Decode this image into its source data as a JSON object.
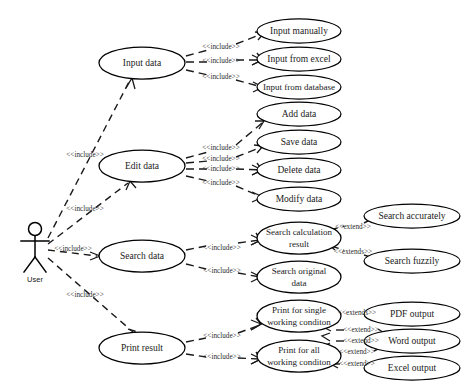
{
  "diagram": {
    "type": "uml-use-case-diagram",
    "actor": {
      "name": "User",
      "icon": "stick-figure-actor-icon"
    },
    "stereotypes": {
      "include": "<<include>>",
      "extend": "<<extend>>",
      "extends": "<<extends>>"
    },
    "primary_use_cases": [
      {
        "id": "input_data",
        "label": "Input data",
        "cx": 142,
        "cy": 63,
        "rx": 43,
        "ry": 16
      },
      {
        "id": "edit_data",
        "label": "Edit data",
        "cx": 142,
        "cy": 166,
        "rx": 43,
        "ry": 16
      },
      {
        "id": "search_data",
        "label": "Search data",
        "cx": 142,
        "cy": 256,
        "rx": 43,
        "ry": 16
      },
      {
        "id": "print_result",
        "label": "Print result",
        "cx": 142,
        "cy": 348,
        "rx": 43,
        "ry": 16
      }
    ],
    "secondary_use_cases": [
      {
        "id": "input_manually",
        "label": "Input manually",
        "cx": 299,
        "cy": 31,
        "rx": 42,
        "ry": 12
      },
      {
        "id": "input_from_excel",
        "label": "Input from excel",
        "cx": 299,
        "cy": 59,
        "rx": 42,
        "ry": 12
      },
      {
        "id": "input_from_database",
        "label": "Input from database",
        "cx": 299,
        "cy": 87,
        "rx": 42,
        "ry": 12
      },
      {
        "id": "add_data",
        "label": "Add data",
        "cx": 299,
        "cy": 114,
        "rx": 42,
        "ry": 12
      },
      {
        "id": "save_data",
        "label": "Save data",
        "cx": 299,
        "cy": 142,
        "rx": 42,
        "ry": 12
      },
      {
        "id": "delete_data",
        "label": "Delete data",
        "cx": 299,
        "cy": 170,
        "rx": 42,
        "ry": 12
      },
      {
        "id": "modify_data",
        "label": "Modify data",
        "cx": 299,
        "cy": 199,
        "rx": 42,
        "ry": 12
      },
      {
        "id": "search_calculation_result",
        "label": "Search calculation result",
        "line1": "Search calculation",
        "line2": "result",
        "cx": 299,
        "cy": 238,
        "rx": 42,
        "ry": 16
      },
      {
        "id": "search_original_data",
        "label": "Search original data",
        "line1": "Search original",
        "line2": "data",
        "cx": 299,
        "cy": 277,
        "rx": 42,
        "ry": 16
      },
      {
        "id": "print_single_working_condition",
        "label": "Print for single working condition",
        "line1": "Print for single",
        "line2": "working conditon",
        "cx": 299,
        "cy": 316,
        "rx": 42,
        "ry": 16
      },
      {
        "id": "print_all_working_condition",
        "label": "Print for all working condition",
        "line1": "Print for all",
        "line2": "working conditon",
        "cx": 299,
        "cy": 356,
        "rx": 42,
        "ry": 16
      }
    ],
    "extension_use_cases": [
      {
        "id": "search_accurately",
        "label": "Search accurately",
        "cx": 412,
        "cy": 216,
        "rx": 48,
        "ry": 12
      },
      {
        "id": "search_fuzzily",
        "label": "Search fuzzily",
        "cx": 412,
        "cy": 261,
        "rx": 48,
        "ry": 12
      },
      {
        "id": "pdf_output",
        "label": "PDF output",
        "cx": 412,
        "cy": 314,
        "rx": 48,
        "ry": 12
      },
      {
        "id": "word_output",
        "label": "Word output",
        "cx": 412,
        "cy": 341,
        "rx": 48,
        "ry": 12
      },
      {
        "id": "excel_output",
        "label": "Excel output",
        "cx": 412,
        "cy": 368,
        "rx": 48,
        "ry": 12
      }
    ],
    "actor_relations": [
      {
        "id": "actor_to_input",
        "label": "<<include>>",
        "lx": 85,
        "ly": 155
      },
      {
        "id": "actor_to_edit",
        "label": "<<include>>",
        "lx": 85,
        "ly": 209
      },
      {
        "id": "actor_to_search",
        "label": "<<include>>",
        "lx": 73,
        "ly": 249
      },
      {
        "id": "actor_to_print",
        "label": "<<include>>",
        "lx": 85,
        "ly": 295
      }
    ],
    "include_relations": [
      {
        "id": "input_to_manually",
        "label": "<<include>>",
        "lx": 216,
        "ly": 48
      },
      {
        "id": "input_to_excel",
        "label": "<<include>>",
        "lx": 216,
        "ly": 62
      },
      {
        "id": "input_to_database",
        "label": "<<include>>",
        "lx": 216,
        "ly": 76
      },
      {
        "id": "edit_to_add",
        "label": "<<include>>",
        "lx": 216,
        "ly": 149
      },
      {
        "id": "edit_to_save",
        "label": "<<include>>",
        "lx": 216,
        "ly": 163
      },
      {
        "id": "edit_to_delete",
        "label": "<<include>>",
        "lx": 216,
        "ly": 169
      },
      {
        "id": "edit_to_modify",
        "label": "<<include>>",
        "lx": 216,
        "ly": 184
      },
      {
        "id": "search_to_calc",
        "label": "<<include>>",
        "lx": 218,
        "ly": 249
      },
      {
        "id": "search_to_original",
        "label": "<<include>>",
        "lx": 218,
        "ly": 270
      },
      {
        "id": "print_to_single",
        "label": "<<include>>",
        "lx": 218,
        "ly": 335
      },
      {
        "id": "print_to_all",
        "label": "<<include>>",
        "lx": 218,
        "ly": 356
      }
    ],
    "extend_relations": [
      {
        "id": "accurately_extends_calc",
        "label": "<<extend>>",
        "lx": 352,
        "ly": 228
      },
      {
        "id": "fuzzily_extends_calc",
        "label": "<<extends>>",
        "lx": 352,
        "ly": 253
      },
      {
        "id": "pdf_extends_single",
        "label": "<<extends>>",
        "lx": 356,
        "ly": 313
      },
      {
        "id": "word_extends_single",
        "label": "<<extend>>",
        "lx": 360,
        "ly": 330
      },
      {
        "id": "excel_extends_single",
        "label": "<<extend>>",
        "lx": 360,
        "ly": 341
      },
      {
        "id": "word_extends_all",
        "label": "<<extend>>",
        "lx": 356,
        "ly": 352
      },
      {
        "id": "excel_extends_all",
        "label": "<<extend>>",
        "lx": 356,
        "ly": 364
      }
    ]
  }
}
